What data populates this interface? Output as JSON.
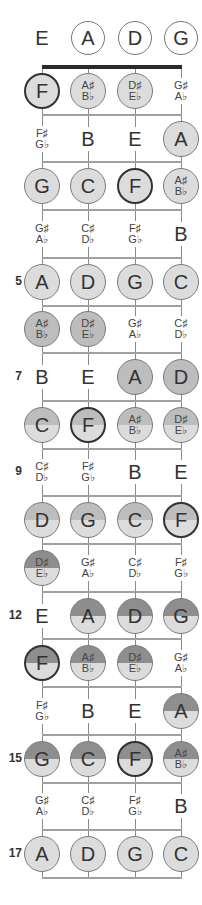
{
  "diagram": {
    "strings": [
      "E",
      "A",
      "D",
      "G"
    ],
    "open_strings": [
      {
        "label": "E",
        "circled": false
      },
      {
        "label": "A",
        "circled": true
      },
      {
        "label": "D",
        "circled": true
      },
      {
        "label": "G",
        "circled": true
      }
    ],
    "fret_markers": [
      {
        "fret": 5,
        "label": "5"
      },
      {
        "fret": 7,
        "label": "7"
      },
      {
        "fret": 9,
        "label": "9"
      },
      {
        "fret": 12,
        "label": "12"
      },
      {
        "fret": 15,
        "label": "15"
      },
      {
        "fret": 17,
        "label": "17"
      }
    ],
    "shading_legend": {
      "plain": "#ffffff",
      "light": "#dcdcdc",
      "medium": "#bdbdbd",
      "dark": "#8e8e8e",
      "root_border": "#333333"
    },
    "frets": [
      {
        "fret": 1,
        "notes": [
          {
            "top": "F",
            "bottom": "",
            "circled": true,
            "root": true,
            "shade": "light"
          },
          {
            "top": "A♯",
            "bottom": "B♭",
            "circled": true,
            "root": false,
            "shade": "light"
          },
          {
            "top": "D♯",
            "bottom": "E♭",
            "circled": true,
            "root": false,
            "shade": "light"
          },
          {
            "top": "G♯",
            "bottom": "A♭",
            "circled": false,
            "root": false,
            "shade": "plain"
          }
        ]
      },
      {
        "fret": 2,
        "notes": [
          {
            "top": "F♯",
            "bottom": "G♭",
            "circled": false,
            "root": false,
            "shade": "plain"
          },
          {
            "top": "B",
            "bottom": "",
            "circled": false,
            "root": false,
            "shade": "plain"
          },
          {
            "top": "E",
            "bottom": "",
            "circled": false,
            "root": false,
            "shade": "plain"
          },
          {
            "top": "A",
            "bottom": "",
            "circled": true,
            "root": false,
            "shade": "light"
          }
        ]
      },
      {
        "fret": 3,
        "notes": [
          {
            "top": "G",
            "bottom": "",
            "circled": true,
            "root": false,
            "shade": "light"
          },
          {
            "top": "C",
            "bottom": "",
            "circled": true,
            "root": false,
            "shade": "light"
          },
          {
            "top": "F",
            "bottom": "",
            "circled": true,
            "root": true,
            "shade": "light"
          },
          {
            "top": "A♯",
            "bottom": "B♭",
            "circled": true,
            "root": false,
            "shade": "light"
          }
        ]
      },
      {
        "fret": 4,
        "notes": [
          {
            "top": "G♯",
            "bottom": "A♭",
            "circled": false,
            "root": false,
            "shade": "plain"
          },
          {
            "top": "C♯",
            "bottom": "D♭",
            "circled": false,
            "root": false,
            "shade": "plain"
          },
          {
            "top": "F♯",
            "bottom": "G♭",
            "circled": false,
            "root": false,
            "shade": "plain"
          },
          {
            "top": "B",
            "bottom": "",
            "circled": false,
            "root": false,
            "shade": "plain"
          }
        ]
      },
      {
        "fret": 5,
        "notes": [
          {
            "top": "A",
            "bottom": "",
            "circled": true,
            "root": false,
            "shade": "light"
          },
          {
            "top": "D",
            "bottom": "",
            "circled": true,
            "root": false,
            "shade": "light"
          },
          {
            "top": "G",
            "bottom": "",
            "circled": true,
            "root": false,
            "shade": "light"
          },
          {
            "top": "C",
            "bottom": "",
            "circled": true,
            "root": false,
            "shade": "light"
          }
        ]
      },
      {
        "fret": 6,
        "notes": [
          {
            "top": "A♯",
            "bottom": "B♭",
            "circled": true,
            "root": false,
            "shade": "medium"
          },
          {
            "top": "D♯",
            "bottom": "E♭",
            "circled": true,
            "root": false,
            "shade": "medium"
          },
          {
            "top": "G♯",
            "bottom": "A♭",
            "circled": false,
            "root": false,
            "shade": "plain"
          },
          {
            "top": "C♯",
            "bottom": "D♭",
            "circled": false,
            "root": false,
            "shade": "plain"
          }
        ]
      },
      {
        "fret": 7,
        "notes": [
          {
            "top": "B",
            "bottom": "",
            "circled": false,
            "root": false,
            "shade": "plain"
          },
          {
            "top": "E",
            "bottom": "",
            "circled": false,
            "root": false,
            "shade": "plain"
          },
          {
            "top": "A",
            "bottom": "",
            "circled": true,
            "root": false,
            "shade": "medium"
          },
          {
            "top": "D",
            "bottom": "",
            "circled": true,
            "root": false,
            "shade": "medium"
          }
        ]
      },
      {
        "fret": 8,
        "notes": [
          {
            "top": "C",
            "bottom": "",
            "circled": true,
            "root": false,
            "shade": "split-medium"
          },
          {
            "top": "F",
            "bottom": "",
            "circled": true,
            "root": true,
            "shade": "split-medium"
          },
          {
            "top": "A♯",
            "bottom": "B♭",
            "circled": true,
            "root": false,
            "shade": "split-medium"
          },
          {
            "top": "D♯",
            "bottom": "E♭",
            "circled": true,
            "root": false,
            "shade": "split-medium"
          }
        ]
      },
      {
        "fret": 9,
        "notes": [
          {
            "top": "C♯",
            "bottom": "D♭",
            "circled": false,
            "root": false,
            "shade": "plain"
          },
          {
            "top": "F♯",
            "bottom": "G♭",
            "circled": false,
            "root": false,
            "shade": "plain"
          },
          {
            "top": "B",
            "bottom": "",
            "circled": false,
            "root": false,
            "shade": "plain"
          },
          {
            "top": "E",
            "bottom": "",
            "circled": false,
            "root": false,
            "shade": "plain"
          }
        ]
      },
      {
        "fret": 10,
        "notes": [
          {
            "top": "D",
            "bottom": "",
            "circled": true,
            "root": false,
            "shade": "split-medium"
          },
          {
            "top": "G",
            "bottom": "",
            "circled": true,
            "root": false,
            "shade": "split-medium"
          },
          {
            "top": "C",
            "bottom": "",
            "circled": true,
            "root": false,
            "shade": "split-medium"
          },
          {
            "top": "F",
            "bottom": "",
            "circled": true,
            "root": true,
            "shade": "split-medium"
          }
        ]
      },
      {
        "fret": 11,
        "notes": [
          {
            "top": "D♯",
            "bottom": "E♭",
            "circled": true,
            "root": false,
            "shade": "split-dark"
          },
          {
            "top": "G♯",
            "bottom": "A♭",
            "circled": false,
            "root": false,
            "shade": "plain"
          },
          {
            "top": "C♯",
            "bottom": "D♭",
            "circled": false,
            "root": false,
            "shade": "plain"
          },
          {
            "top": "F♯",
            "bottom": "G♭",
            "circled": false,
            "root": false,
            "shade": "plain"
          }
        ]
      },
      {
        "fret": 12,
        "notes": [
          {
            "top": "E",
            "bottom": "",
            "circled": false,
            "root": false,
            "shade": "plain"
          },
          {
            "top": "A",
            "bottom": "",
            "circled": true,
            "root": false,
            "shade": "split-dark"
          },
          {
            "top": "D",
            "bottom": "",
            "circled": true,
            "root": false,
            "shade": "split-dark"
          },
          {
            "top": "G",
            "bottom": "",
            "circled": true,
            "root": false,
            "shade": "split-dark"
          }
        ]
      },
      {
        "fret": 13,
        "notes": [
          {
            "top": "F",
            "bottom": "",
            "circled": true,
            "root": true,
            "shade": "split-dark"
          },
          {
            "top": "A♯",
            "bottom": "B♭",
            "circled": true,
            "root": false,
            "shade": "split-dark"
          },
          {
            "top": "D♯",
            "bottom": "E♭",
            "circled": true,
            "root": false,
            "shade": "split-dark"
          },
          {
            "top": "G♯",
            "bottom": "A♭",
            "circled": false,
            "root": false,
            "shade": "plain"
          }
        ]
      },
      {
        "fret": 14,
        "notes": [
          {
            "top": "F♯",
            "bottom": "G♭",
            "circled": false,
            "root": false,
            "shade": "plain"
          },
          {
            "top": "B",
            "bottom": "",
            "circled": false,
            "root": false,
            "shade": "plain"
          },
          {
            "top": "E",
            "bottom": "",
            "circled": false,
            "root": false,
            "shade": "plain"
          },
          {
            "top": "A",
            "bottom": "",
            "circled": true,
            "root": false,
            "shade": "split-dark"
          }
        ]
      },
      {
        "fret": 15,
        "notes": [
          {
            "top": "G",
            "bottom": "",
            "circled": true,
            "root": false,
            "shade": "split-dark"
          },
          {
            "top": "C",
            "bottom": "",
            "circled": true,
            "root": false,
            "shade": "split-dark"
          },
          {
            "top": "F",
            "bottom": "",
            "circled": true,
            "root": true,
            "shade": "split-dark"
          },
          {
            "top": "A♯",
            "bottom": "B♭",
            "circled": true,
            "root": false,
            "shade": "split-dark"
          }
        ]
      },
      {
        "fret": 16,
        "notes": [
          {
            "top": "G♯",
            "bottom": "A♭",
            "circled": false,
            "root": false,
            "shade": "plain"
          },
          {
            "top": "C♯",
            "bottom": "D♭",
            "circled": false,
            "root": false,
            "shade": "plain"
          },
          {
            "top": "F♯",
            "bottom": "G♭",
            "circled": false,
            "root": false,
            "shade": "plain"
          },
          {
            "top": "B",
            "bottom": "",
            "circled": false,
            "root": false,
            "shade": "plain"
          }
        ]
      },
      {
        "fret": 17,
        "notes": [
          {
            "top": "A",
            "bottom": "",
            "circled": true,
            "root": false,
            "shade": "light"
          },
          {
            "top": "D",
            "bottom": "",
            "circled": true,
            "root": false,
            "shade": "light"
          },
          {
            "top": "G",
            "bottom": "",
            "circled": true,
            "root": false,
            "shade": "light"
          },
          {
            "top": "C",
            "bottom": "",
            "circled": true,
            "root": false,
            "shade": "light"
          }
        ]
      }
    ]
  }
}
